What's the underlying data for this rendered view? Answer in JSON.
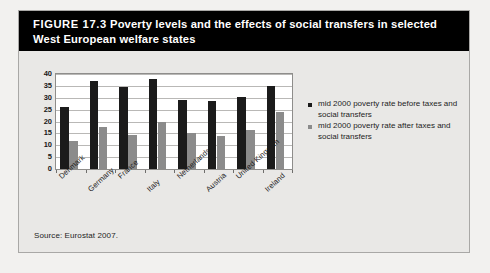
{
  "figure": {
    "label": "FIGURE 17.3",
    "title": "Poverty levels and the effects of social transfers in selected West European welfare states",
    "source": "Source: Eurostat 2007."
  },
  "legend": {
    "items": [
      {
        "marker": "square-dark",
        "label": "mid 2000 poverty rate before taxes and social transfers",
        "color": "#1b1b1b"
      },
      {
        "marker": "square-gray",
        "label": "mid 2000 poverty rate after taxes and social transfers",
        "color": "#8b8b8b"
      }
    ]
  },
  "chart_data": {
    "type": "bar",
    "title": "Poverty levels and the effects of social transfers in selected West European welfare states",
    "xlabel": "",
    "ylabel": "",
    "ylim": [
      0,
      40
    ],
    "yticks": [
      0,
      5,
      10,
      15,
      20,
      25,
      30,
      35,
      40
    ],
    "grid": true,
    "legend_position": "right",
    "categories": [
      "Denmark",
      "Germany",
      "France",
      "Italy",
      "Netherlands",
      "Austria",
      "United Kingdom",
      "Ireland"
    ],
    "series": [
      {
        "name": "mid 2000 poverty rate before taxes and social transfers",
        "color": "#1b1b1b",
        "values": [
          26,
          37,
          34.5,
          38,
          29,
          28.5,
          30.5,
          35
        ]
      },
      {
        "name": "mid 2000 poverty rate after taxes and social transfers",
        "color": "#8b8b8b",
        "values": [
          12,
          17.5,
          14.5,
          20,
          15,
          14,
          16.5,
          24
        ]
      }
    ]
  }
}
